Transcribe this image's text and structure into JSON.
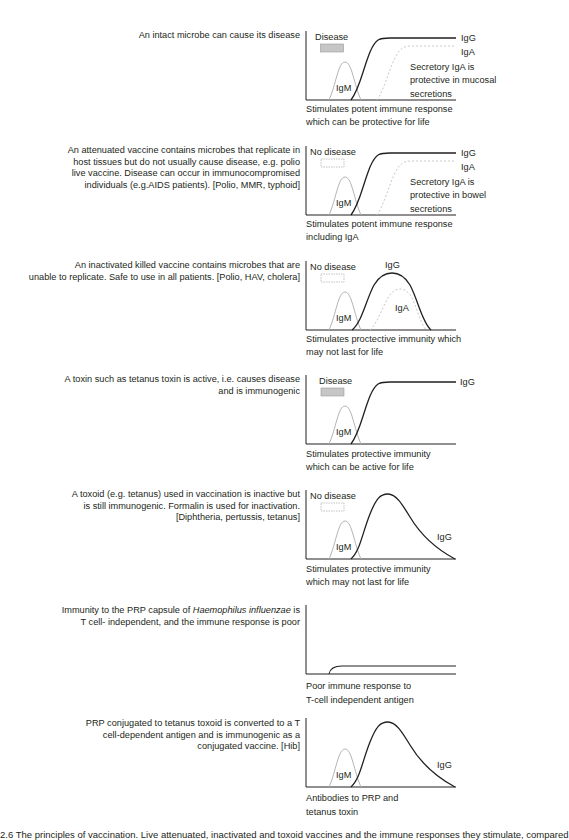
{
  "panels": [
    {
      "id": "intact-microbe",
      "description_lines": [
        "An intact microbe can cause its disease"
      ],
      "disease_label": "Disease",
      "disease_box": "filled",
      "curves": [
        "IgM",
        "IgG",
        "IgA"
      ],
      "labels": {
        "igm": "IgM",
        "igg": "IgG",
        "iga": "IgA"
      },
      "note_lines": [
        "Secretory IgA is",
        "protective in mucosal",
        "secretions"
      ],
      "caption_lines": [
        "Stimulates potent immune response",
        "which can be protective for life"
      ]
    },
    {
      "id": "attenuated-vaccine",
      "description_lines": [
        "An attenuated vaccine contains microbes that replicate in",
        "host tissues but do not usually cause disease, e.g. polio",
        "live vaccine. Disease can occur in immunocompromised",
        "individuals (e.g.AIDS patients). [Polio, MMR, typhoid]"
      ],
      "disease_label": "No disease",
      "disease_box": "dashed",
      "labels": {
        "igm": "IgM",
        "igg": "IgG",
        "iga": "IgA"
      },
      "note_lines": [
        "Secretory IgA is",
        "protective in bowel",
        "secretions"
      ],
      "caption_lines": [
        "Stimulates potent immune response",
        "including IgA"
      ]
    },
    {
      "id": "inactivated-vaccine",
      "description_lines": [
        "An inactivated killed vaccine contains microbes that are",
        "unable to replicate. Safe to use in all patients. [Polio, HAV, cholera]"
      ],
      "disease_label": "No disease",
      "disease_box": "dashed",
      "labels": {
        "igm": "IgM",
        "igg": "IgG",
        "iga": "IgA"
      },
      "caption_lines": [
        "Stimulates proctective immunity which",
        "may not last for life"
      ]
    },
    {
      "id": "toxin",
      "description_lines": [
        "A toxin such as tetanus toxin is active, i.e. causes disease",
        "and is immunogenic"
      ],
      "disease_label": "Disease",
      "disease_box": "filled",
      "labels": {
        "igm": "IgM",
        "igg": "IgG"
      },
      "caption_lines": [
        "Stimulates protective immunity",
        "which can be active for life"
      ]
    },
    {
      "id": "toxoid",
      "description_lines": [
        "A toxoid (e.g. tetanus) used in vaccination is inactive but",
        "is still immunogenic. Formalin is used for inactivation.",
        "[Diphtheria, pertussis, tetanus]"
      ],
      "disease_label": "No disease",
      "disease_box": "dashed",
      "labels": {
        "igm": "IgM",
        "igg": "IgG"
      },
      "caption_lines": [
        "Stimulates protective immunity",
        "which may not last for life"
      ]
    },
    {
      "id": "prp-capsule",
      "description_lines": [
        "Immunity to the PRP capsule of |Haemophilus influenzae| is",
        "T cell- independent, and the immune response is poor"
      ],
      "description_parts": {
        "line1_pre": "Immunity to the PRP capsule of ",
        "line1_italic": "Haemophilus influenzae",
        "line1_post": " is",
        "line2": "T cell- independent, and the immune response is poor"
      },
      "caption_lines": [
        "Poor immune response to",
        "T-cell independent antigen"
      ]
    },
    {
      "id": "prp-conjugate",
      "description_lines": [
        "PRP conjugated to tetanus toxoid is converted to a T",
        "cell-dependent antigen and is immunogenic as a",
        "conjugated vaccine. [Hib]"
      ],
      "labels": {
        "igm": "IgM",
        "igg": "IgG"
      },
      "caption_lines": [
        "Antibodies to PRP and",
        "tetanus toxin"
      ]
    }
  ],
  "footer": {
    "caption": "2.6 The principles of vaccination. Live attenuated, inactivated and toxoid vaccines and the immune responses they stimulate, compared"
  },
  "colors": {
    "text": "#231f20",
    "igg_line": "#231f20",
    "igm_line": "#b3b3b3",
    "iga_dashed": "#c8c8c8",
    "disease_fill": "#c6c6c6",
    "disease_box_border": "#9a9a9a"
  }
}
